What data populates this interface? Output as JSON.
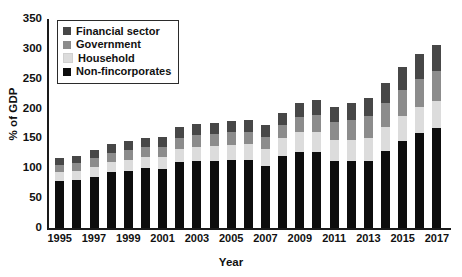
{
  "chart_data": {
    "type": "bar",
    "stacked": true,
    "title": "",
    "xlabel": "Year",
    "ylabel": "% of GDP",
    "ylim": [
      0,
      350
    ],
    "ytick_values": [
      0,
      50,
      100,
      150,
      200,
      250,
      300,
      350
    ],
    "ytick_labels": [
      "0",
      "50",
      "100",
      "150",
      "200",
      "250",
      "300",
      "350"
    ],
    "grid": false,
    "legend_position": "upper-left",
    "categories": [
      "1995",
      "1996",
      "1997",
      "1998",
      "1999",
      "2000",
      "2001",
      "2002",
      "2003",
      "2004",
      "2005",
      "2006",
      "2007",
      "2008",
      "2009",
      "2010",
      "2011",
      "2012",
      "2013",
      "2014",
      "2015",
      "2016",
      "2017"
    ],
    "xtick_labels": [
      "1995",
      "1997",
      "1999",
      "2001",
      "2003",
      "2005",
      "2007",
      "2009",
      "2011",
      "2013",
      "2015",
      "2017"
    ],
    "series": [
      {
        "name": "Non-fincorporates",
        "color": "#0d0d0d",
        "values": [
          78,
          80,
          86,
          94,
          96,
          100,
          99,
          110,
          113,
          113,
          114,
          114,
          104,
          120,
          128,
          128,
          112,
          112,
          113,
          129,
          146,
          159,
          168
        ]
      },
      {
        "name": "Household",
        "color": "#dcdcdc",
        "values": [
          16,
          16,
          17,
          17,
          18,
          19,
          20,
          22,
          23,
          24,
          25,
          26,
          28,
          30,
          32,
          33,
          35,
          36,
          37,
          40,
          41,
          43,
          45
        ]
      },
      {
        "name": "Government",
        "color": "#8c8c8c",
        "values": [
          12,
          13,
          14,
          15,
          16,
          16,
          17,
          19,
          20,
          20,
          21,
          21,
          21,
          22,
          26,
          28,
          30,
          33,
          37,
          40,
          44,
          47,
          50
        ]
      },
      {
        "name": "Financial sector",
        "color": "#474747",
        "values": [
          12,
          12,
          13,
          14,
          15,
          16,
          16,
          18,
          19,
          19,
          19,
          20,
          20,
          21,
          24,
          25,
          26,
          28,
          31,
          34,
          38,
          42,
          44
        ]
      }
    ],
    "totals": [
      118,
      121,
      130,
      140,
      145,
      151,
      152,
      169,
      175,
      176,
      179,
      181,
      173,
      193,
      210,
      214,
      203,
      209,
      218,
      243,
      269,
      291,
      307
    ],
    "stack_order_bottom_to_top": [
      "Non-fincorporates",
      "Household",
      "Government",
      "Financial sector"
    ]
  },
  "legend": {
    "items": [
      {
        "label": "Financial sector",
        "color": "#474747"
      },
      {
        "label": "Government",
        "color": "#8c8c8c"
      },
      {
        "label": "Household",
        "color": "#dcdcdc"
      },
      {
        "label": "Non-fincorporates",
        "color": "#0d0d0d"
      }
    ]
  },
  "bleed_text": {
    "lines": [
      "federal lending, private lending, debt and public",
      "and federal lending it even had been reported",
      "corners, fiscal policy makers must raise",
      "for the next few quarters and they may then",
      "crisis. Another 1995 is unlikely,",
      "",
      "government Credit: Global Debt",
      "Global Debt and Its Distribution",
      "",
      "corners crises, fiscal policymakers",
      "lending was their own following global",
      "were relatively difficult, relevant"
    ]
  }
}
